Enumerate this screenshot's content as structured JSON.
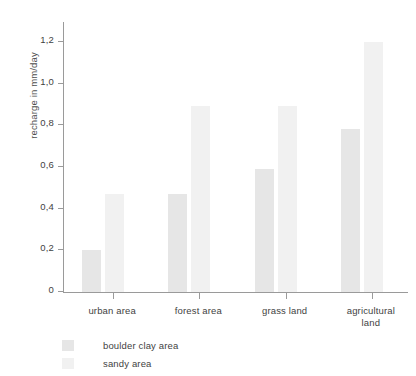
{
  "chart_data": {
    "type": "bar",
    "title": "",
    "xlabel": "",
    "ylabel": "recharge in mm/day",
    "categories": [
      "urban area",
      "forest area",
      "grass land",
      "agricultural land"
    ],
    "series": [
      {
        "name": "boulder clay area",
        "color": "#e6e6e6",
        "values": [
          0.2,
          0.47,
          0.59,
          0.78
        ]
      },
      {
        "name": "sandy area",
        "color": "#f1f1f1",
        "values": [
          0.47,
          0.89,
          0.89,
          1.2
        ]
      }
    ],
    "ylim": [
      0,
      1.3
    ],
    "yticks": [
      0,
      0.2,
      0.4,
      0.6,
      0.8,
      1.0,
      1.2
    ],
    "ytick_labels": [
      "0",
      "0,2",
      "0,4",
      "0,6",
      "0,8",
      "1,0",
      "1,2"
    ],
    "grid": false,
    "legend_position": "bottom-left",
    "axis_color": "#9a9a9a",
    "text_color": "#3f3f3f"
  },
  "category_labels": [
    {
      "line1": "urban area",
      "line2": ""
    },
    {
      "line1": "forest area",
      "line2": ""
    },
    {
      "line1": "grass land",
      "line2": ""
    },
    {
      "line1": "agricultural",
      "line2": "land"
    }
  ]
}
